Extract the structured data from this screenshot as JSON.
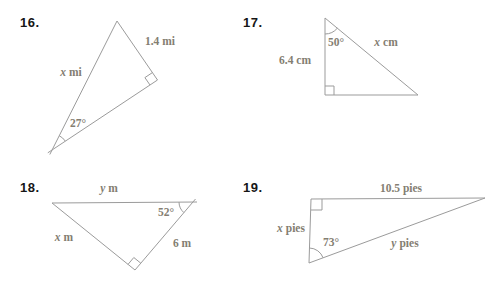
{
  "canvas": {
    "width": 504,
    "height": 291,
    "background": "#ffffff"
  },
  "colors": {
    "line": "#9b9b9b",
    "label_text": "#847e72",
    "number_text": "#161616"
  },
  "problems": [
    {
      "number": "16.",
      "labels": {
        "hyp": "1.4 mi",
        "left_var": "x",
        "left_unit": "mi",
        "angle": "27°"
      }
    },
    {
      "number": "17.",
      "labels": {
        "angle": "50°",
        "hyp_var": "x",
        "hyp_unit": "cm",
        "left": "6.4 cm"
      }
    },
    {
      "number": "18.",
      "labels": {
        "top_var": "y",
        "top_unit": "m",
        "angle": "52°",
        "left_var": "x",
        "left_unit": "m",
        "right": "6 m"
      }
    },
    {
      "number": "19.",
      "labels": {
        "top": "10.5 pies",
        "left_var": "x",
        "left_unit": "pies",
        "angle": "73°",
        "hyp_var": "y",
        "hyp_unit": "pies"
      }
    }
  ]
}
